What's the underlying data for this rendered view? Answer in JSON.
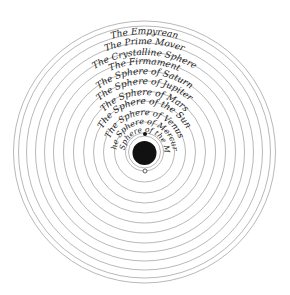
{
  "diagram": {
    "center": {
      "x": 144.5,
      "y": 152
    },
    "earth": {
      "radius": 12,
      "color": "#111111",
      "ring_radius": 16
    },
    "moon_marker_filled": {
      "x": 145,
      "y": 134
    },
    "moon_marker_open": {
      "x": 145,
      "y": 171
    },
    "line_color": "#9a9a9a",
    "spheres": [
      {
        "label": "The Sphere of the Moon",
        "radius": 19
      },
      {
        "label": "The Sphere of Mercury",
        "radius": 30
      },
      {
        "label": "The Sphere of Venus",
        "radius": 41
      },
      {
        "label": "The Sphere of the Sun",
        "radius": 51
      },
      {
        "label": "The Sphere of Mars",
        "radius": 61
      },
      {
        "label": "The Sphere of Jupiter",
        "radius": 71
      },
      {
        "label": "The Sphere of Saturn",
        "radius": 81
      },
      {
        "label": "The Firmament",
        "radius": 91
      },
      {
        "label": "The Crystalline Sphere",
        "radius": 100
      },
      {
        "label": "The Prime Mover",
        "radius": 109
      },
      {
        "label": "The Empyrean",
        "radius": 118
      }
    ],
    "extra_rings": [
      126,
      131
    ],
    "labels": {
      "moon": "The Sphere of the Moon",
      "mercury": "The Sphere of Mercury",
      "venus": "The Sphere of Venus",
      "sun": "The Sphere of the Sun",
      "mars": "The Sphere of Mars",
      "jupiter": "The Sphere of Jupiter",
      "saturn": "The Sphere of Saturn",
      "firmament": "The Firmament",
      "crystalline": "The Crystalline Sphere",
      "prime_mover": "The Prime Mover",
      "empyrean": "The Empyrean"
    }
  }
}
